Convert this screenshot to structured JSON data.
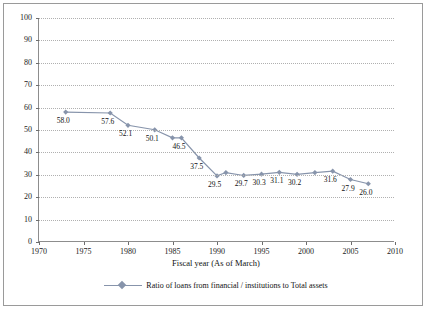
{
  "chart_data": {
    "type": "line",
    "title": "",
    "xlabel": "Fiscal year (As of March)",
    "ylabel": "",
    "xlim": [
      1970,
      2010
    ],
    "ylim": [
      0,
      100
    ],
    "grid": true,
    "legend_position": "bottom",
    "xticks": [
      "1970",
      "1975",
      "1980",
      "1985",
      "1990",
      "1995",
      "2000",
      "2005",
      "2010"
    ],
    "yticks": [
      "0",
      "10",
      "20",
      "30",
      "40",
      "50",
      "60",
      "70",
      "80",
      "90",
      "100"
    ],
    "series": [
      {
        "name": "Ratio of loans from financial / institutions to Total assets",
        "color": "#8794ab",
        "x": [
          1973,
          1978,
          1980,
          1983,
          1985,
          1986,
          1988,
          1990,
          1991,
          1993,
          1995,
          1997,
          1999,
          2001,
          2003,
          2005,
          2007
        ],
        "values": [
          58.0,
          57.6,
          52.1,
          50.1,
          46.5,
          46.5,
          37.5,
          29.5,
          31.0,
          29.7,
          30.3,
          31.1,
          30.2,
          31.0,
          31.6,
          27.9,
          26.0
        ],
        "point_labels": [
          {
            "x": 1973,
            "y": 58.0,
            "text": "58.0"
          },
          {
            "x": 1978,
            "y": 57.6,
            "text": "57.6"
          },
          {
            "x": 1980,
            "y": 52.1,
            "text": "52.1"
          },
          {
            "x": 1983,
            "y": 50.1,
            "text": "50.1"
          },
          {
            "x": 1986,
            "y": 46.5,
            "text": "46.5"
          },
          {
            "x": 1988,
            "y": 37.5,
            "text": "37.5"
          },
          {
            "x": 1990,
            "y": 29.5,
            "text": "29.5"
          },
          {
            "x": 1993,
            "y": 29.7,
            "text": "29.7"
          },
          {
            "x": 1995,
            "y": 30.3,
            "text": "30.3"
          },
          {
            "x": 1997,
            "y": 31.1,
            "text": "31.1"
          },
          {
            "x": 1999,
            "y": 30.2,
            "text": "30.2"
          },
          {
            "x": 2003,
            "y": 31.6,
            "text": "31.6"
          },
          {
            "x": 2005,
            "y": 27.9,
            "text": "27.9"
          },
          {
            "x": 2007,
            "y": 26.0,
            "text": "26.0"
          }
        ]
      }
    ]
  },
  "legend": {
    "label": "Ratio of loans from financial / institutions to Total assets"
  },
  "axis": {
    "x_title": "Fiscal year (As of March)"
  }
}
